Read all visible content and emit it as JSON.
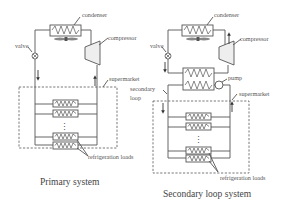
{
  "figure": {
    "type": "diagram",
    "colors": {
      "line": "#555555",
      "text": "#555555",
      "background": "#ffffff",
      "compressor_fill": "#eeeeee"
    }
  },
  "primary": {
    "caption": "Primary system",
    "labels": {
      "condenser": "condenser",
      "compressor": "compressor",
      "valve": "valve",
      "supermarket": "supermarket",
      "loads": "refrigeration loads"
    },
    "load_count_visible": 4,
    "ellipsis": "⋮"
  },
  "secondary": {
    "caption": "Secondary loop system",
    "labels": {
      "condenser": "condenser",
      "compressor": "compressor",
      "valve": "valve",
      "pump": "pump",
      "supermarket": "supermarket",
      "secondary_loop_1": "secondary",
      "secondary_loop_2": "loop",
      "loads": "refrigeration loads"
    },
    "load_count_visible": 4,
    "ellipsis": "⋮"
  }
}
